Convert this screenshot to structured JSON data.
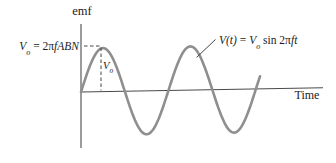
{
  "figure": {
    "y_axis_label": "emf",
    "x_axis_label": "Time",
    "equations": {
      "peak": {
        "var": "V",
        "sub": "o",
        "mid": " = 2π",
        "vars": "fABN"
      },
      "wave": {
        "var": "V(t)",
        "mid1": " = ",
        "var2": "V",
        "sub2": "o",
        "mid2": " sin 2π",
        "vars": "ft"
      },
      "amplitude_marker": {
        "var": "V",
        "sub": "o"
      }
    }
  },
  "colors": {
    "wave": "#8f8f8f",
    "axis": "#4a4a4a",
    "annotation": "#454545",
    "text": "#1c1c1c",
    "background": "#ffffff"
  },
  "chart_data": {
    "type": "line",
    "xlabel": "Time",
    "ylabel": "emf",
    "function": "V(t) = Vo sin 2πft",
    "amplitude_relation": "Vo = 2πfABN",
    "x_periods": [
      0,
      0.25,
      0.5,
      0.75,
      1.0,
      1.25,
      1.5,
      1.75,
      2.0
    ],
    "values_in_Vo": [
      0,
      1,
      0,
      -1,
      0,
      1,
      0,
      -1,
      0
    ],
    "cycles_shown": 2.05,
    "legend": "none",
    "grid": false,
    "render": {
      "x0": 81,
      "x_end": 260,
      "period_px": 87.5,
      "amplitude_px": 43.5,
      "baseline_y0": 92,
      "baseline_y1": 88.6
    }
  }
}
